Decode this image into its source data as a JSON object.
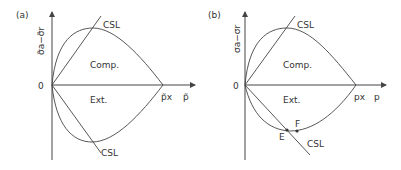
{
  "panels": [
    {
      "id": "a",
      "panel_label": "(a)",
      "y_axis_label": "σ̃a−σ̃r",
      "x_axis_label": "p̃",
      "origin_label": "0",
      "intercept_label": "p̃x",
      "region_upper": "Comp.",
      "region_lower": "Ext.",
      "line_upper_label": "CSL",
      "line_lower_label": "CSL"
    },
    {
      "id": "b",
      "panel_label": "(b)",
      "y_axis_label": "σa−σr",
      "x_axis_label": "p",
      "origin_label": "0",
      "intercept_label": "px",
      "region_upper": "Comp.",
      "region_lower": "Ext.",
      "line_upper_label": "CSL",
      "line_lower_label": "CSL",
      "point_e_label": "E",
      "point_f_label": "F"
    }
  ],
  "colors": {
    "line": "#444444",
    "text": "#333333",
    "background": "#ffffff"
  }
}
